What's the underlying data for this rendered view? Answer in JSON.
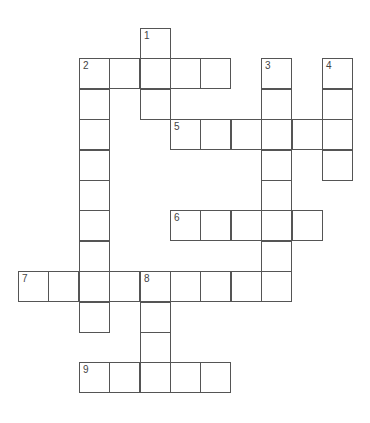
{
  "puzzle": {
    "type": "crossword",
    "grid_origin": {
      "x": 18,
      "y": 28
    },
    "cell_size": 30.4,
    "cells": [
      [
        4,
        0,
        "1"
      ],
      [
        4,
        1,
        ""
      ],
      [
        4,
        2,
        ""
      ],
      [
        2,
        1,
        "2"
      ],
      [
        3,
        1,
        ""
      ],
      [
        5,
        1,
        ""
      ],
      [
        6,
        1,
        ""
      ],
      [
        2,
        2,
        ""
      ],
      [
        2,
        3,
        ""
      ],
      [
        2,
        4,
        ""
      ],
      [
        2,
        5,
        ""
      ],
      [
        2,
        6,
        ""
      ],
      [
        2,
        7,
        ""
      ],
      [
        2,
        8,
        ""
      ],
      [
        2,
        9,
        ""
      ],
      [
        8,
        1,
        "3"
      ],
      [
        8,
        2,
        ""
      ],
      [
        8,
        3,
        ""
      ],
      [
        8,
        4,
        ""
      ],
      [
        8,
        5,
        ""
      ],
      [
        8,
        6,
        ""
      ],
      [
        8,
        7,
        ""
      ],
      [
        8,
        8,
        ""
      ],
      [
        10,
        1,
        "4"
      ],
      [
        10,
        2,
        ""
      ],
      [
        10,
        3,
        ""
      ],
      [
        10,
        4,
        ""
      ],
      [
        5,
        3,
        "5"
      ],
      [
        6,
        3,
        ""
      ],
      [
        7,
        3,
        ""
      ],
      [
        9,
        3,
        ""
      ],
      [
        5,
        6,
        "6"
      ],
      [
        6,
        6,
        ""
      ],
      [
        7,
        6,
        ""
      ],
      [
        9,
        6,
        ""
      ],
      [
        0,
        8,
        "7"
      ],
      [
        1,
        8,
        ""
      ],
      [
        3,
        8,
        ""
      ],
      [
        4,
        8,
        "8"
      ],
      [
        5,
        8,
        ""
      ],
      [
        6,
        8,
        ""
      ],
      [
        7,
        8,
        ""
      ],
      [
        4,
        9,
        ""
      ],
      [
        4,
        10,
        ""
      ],
      [
        2,
        11,
        "9"
      ],
      [
        3,
        11,
        ""
      ],
      [
        4,
        11,
        ""
      ],
      [
        5,
        11,
        ""
      ],
      [
        6,
        11,
        ""
      ]
    ],
    "clue_numbers": [
      "1",
      "2",
      "3",
      "4",
      "5",
      "6",
      "7",
      "8",
      "9"
    ],
    "colors": {
      "border": "#555555",
      "cell_bg": "#ffffff",
      "number": "#444444"
    }
  }
}
